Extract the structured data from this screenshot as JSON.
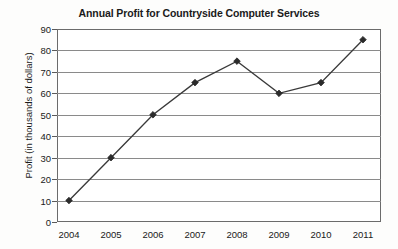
{
  "chart_data": {
    "type": "line",
    "title": "Annual Profit for Countryside Computer Services",
    "xlabel": "",
    "ylabel": "Profit (in thousands of dollars)",
    "categories": [
      "2004",
      "2005",
      "2006",
      "2007",
      "2008",
      "2009",
      "2010",
      "2011"
    ],
    "values": [
      10,
      30,
      50,
      65,
      75,
      60,
      65,
      85
    ],
    "series": [
      {
        "name": "Annual Profit",
        "values": [
          10,
          30,
          50,
          65,
          75,
          60,
          65,
          85
        ]
      }
    ],
    "ylim": [
      0,
      90
    ],
    "ytick_labels": [
      "0",
      "10",
      "20",
      "30",
      "40",
      "50",
      "60",
      "70",
      "80",
      "90"
    ],
    "ytick_values": [
      0,
      10,
      20,
      30,
      40,
      50,
      60,
      70,
      80,
      90
    ],
    "grid": true,
    "grid_axis": "y",
    "legend": false,
    "legend_position": "none",
    "marker": "diamond",
    "line_color": "#3a3a3a",
    "marker_color": "#2b2b2b",
    "grid_color": "#8a8a8a",
    "frame_color": "#6b6b6b",
    "background_color": "#ffffff"
  }
}
